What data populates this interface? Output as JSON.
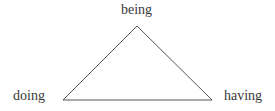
{
  "diagram": {
    "type": "triangle",
    "vertices": {
      "top": {
        "label": "being"
      },
      "bottom_left": {
        "label": "doing"
      },
      "bottom_right": {
        "label": "having"
      }
    },
    "line_color": "#555555",
    "text_color": "#3a3a3a"
  }
}
